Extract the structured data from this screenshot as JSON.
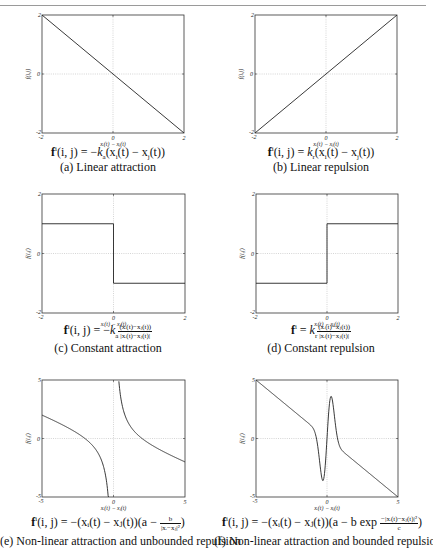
{
  "figure": {
    "panels": [
      {
        "id": "a",
        "formula": {
          "lhs": "f",
          "sup": "i",
          "args": "(i, j) = −",
          "k": "k",
          "ksub": "a",
          "rest": "(x",
          "i": "i",
          "mid": "(t) − x",
          "j": "j",
          "end": "(t))"
        },
        "caption": "(a) Linear attraction"
      },
      {
        "id": "b",
        "formula": {
          "lhs": "f",
          "sup": "i",
          "args": "(i, j) = ",
          "k": "k",
          "ksub": "r",
          "rest": "(x",
          "i": "i",
          "mid": "(t) − x",
          "j": "j",
          "end": "(t))"
        },
        "caption": "(b) Linear repulsion"
      },
      {
        "id": "c",
        "formula": {
          "lhs": "f",
          "sup": "i",
          "args": "(i, j) = −",
          "k": "k",
          "ksub": "a",
          "num": "(xᵢ(t)−xⱼ(t))",
          "den": "|xᵢ(t)−xⱼ(t)|"
        },
        "caption": "(c) Constant attraction"
      },
      {
        "id": "d",
        "formula": {
          "lhs": "f",
          "sup": "i",
          "args": " = ",
          "k": "k",
          "ksub": "r",
          "num": "(xᵢ(t)−xⱼ(t))",
          "den": "|xᵢ(t)−xⱼ(t)|"
        },
        "caption": "(d) Constant repulsion"
      },
      {
        "id": "e",
        "formula": {
          "lhs": "f",
          "sup": "i",
          "args": "(i, j) = −(xᵢ(t) − xⱼ(t))(a − ",
          "num": "b",
          "den": "|xᵢ−xⱼ|²",
          "end": ")"
        },
        "caption": "(e) Non-linear attraction and unbounded repulsion"
      },
      {
        "id": "f",
        "formula": {
          "lhs": "f",
          "sup": "i",
          "args": "(i, j) = −(xᵢ(t) − xⱼ(t))(a − b exp ",
          "num": "−|xᵢ(t)−xⱼ(t)|²",
          "den": "c",
          "end": ")"
        },
        "caption": "(f) Non-linear attraction and bounded repulsion"
      }
    ]
  },
  "chart_data": [
    {
      "id": "a",
      "type": "line",
      "title": "(a) Linear attraction",
      "xlabel": "x_i(t) − x_j(t)",
      "ylabel": "f(i,j)",
      "xlim": [
        -2,
        2
      ],
      "ylim": [
        -2,
        2
      ],
      "xticks": [
        "-2",
        "0",
        "2"
      ],
      "yticks": [
        "-2",
        "0",
        "2"
      ],
      "grid": "zero-lines dotted",
      "x": [
        -2,
        2
      ],
      "y": [
        2,
        -2
      ]
    },
    {
      "id": "b",
      "type": "line",
      "title": "(b) Linear repulsion",
      "xlabel": "x_i(t) − x_j(t)",
      "ylabel": "f(i,j)",
      "xlim": [
        -2,
        2
      ],
      "ylim": [
        -2,
        2
      ],
      "xticks": [
        "-2",
        "0",
        "2"
      ],
      "yticks": [
        "-2",
        "0",
        "2"
      ],
      "grid": "zero-lines dotted",
      "x": [
        -2,
        2
      ],
      "y": [
        -2,
        2
      ]
    },
    {
      "id": "c",
      "type": "line",
      "title": "(c) Constant attraction",
      "xlabel": "x_i(t) − x_j(t)",
      "ylabel": "f(i,j)",
      "xlim": [
        -2,
        2
      ],
      "ylim": [
        -2,
        2
      ],
      "xticks": [
        "-2",
        "0",
        "2"
      ],
      "yticks": [
        "-2",
        "0",
        "2"
      ],
      "grid": "zero-lines dotted",
      "x": [
        -2,
        0,
        0,
        2
      ],
      "y": [
        1,
        1,
        -1,
        -1
      ]
    },
    {
      "id": "d",
      "type": "line",
      "title": "(d) Constant repulsion",
      "xlabel": "x_i(t) − x_j(t)",
      "ylabel": "f(i,j)",
      "xlim": [
        -2,
        2
      ],
      "ylim": [
        -2,
        2
      ],
      "xticks": [
        "-2",
        "0",
        "2"
      ],
      "yticks": [
        "-2",
        "0",
        "2"
      ],
      "grid": "zero-lines dotted",
      "x": [
        -2,
        0,
        0,
        2
      ],
      "y": [
        -1,
        -1,
        1,
        1
      ]
    },
    {
      "id": "e",
      "type": "line",
      "title": "(e) Non-linear attraction and unbounded repulsion",
      "xlabel": "x_i(t) − x_j(t)",
      "ylabel": "f(i,j)",
      "xlim": [
        -5,
        5
      ],
      "ylim": [
        -5,
        5
      ],
      "xticks": [
        "-5",
        "0",
        "5"
      ],
      "yticks": [
        "-5",
        "0",
        "5"
      ],
      "grid": "zero-lines dotted",
      "function": "y = -a*x + b/x",
      "params": {
        "a": 0.476,
        "b": 1.9
      },
      "x": [
        -5,
        -4,
        -3,
        -2,
        -1,
        -0.5,
        -0.4,
        0.4,
        0.5,
        1,
        2,
        3,
        4,
        5
      ],
      "y": [
        2.0,
        1.43,
        0.8,
        0.0,
        -1.43,
        -3.56,
        -4.56,
        4.56,
        3.56,
        1.43,
        0.0,
        -0.8,
        -1.43,
        -2.0
      ]
    },
    {
      "id": "f",
      "type": "line",
      "title": "(f) Non-linear attraction and bounded repulsion",
      "xlabel": "x_i(t) − x_j(t)",
      "ylabel": "f(i,j)",
      "xlim": [
        -5,
        5
      ],
      "ylim": [
        -5,
        5
      ],
      "xticks": [
        "-5",
        "0",
        "5"
      ],
      "yticks": [
        "-5",
        "0",
        "5"
      ],
      "grid": "zero-lines dotted",
      "function": "y = -x*(a - b*exp(-x^2/c))",
      "params": {
        "a": 1,
        "b": 21.4,
        "c": 0.18
      },
      "x": [
        -5,
        -2,
        -1,
        -0.6,
        -0.3,
        0,
        0.3,
        0.6,
        1,
        2,
        5
      ],
      "y": [
        5,
        2,
        1.0,
        -1.8,
        -3.6,
        0,
        3.6,
        1.8,
        -1.0,
        -2,
        -5
      ]
    }
  ]
}
